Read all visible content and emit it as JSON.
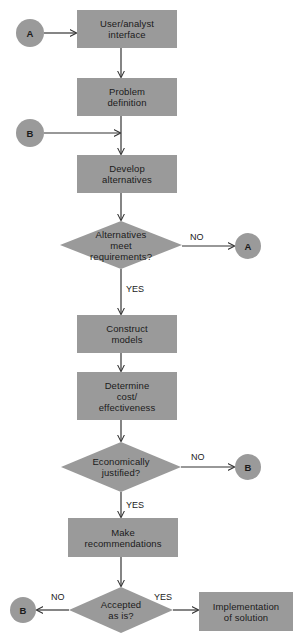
{
  "diagram": {
    "colors": {
      "shape_fill": "#9a9a9a",
      "background": "#ffffff",
      "text": "#1a1a1a",
      "line": "#333333"
    },
    "process_boxes": [
      {
        "id": "user-analyst-interface",
        "label": "User/analyst\ninterface",
        "x": 77,
        "y": 10,
        "w": 100,
        "h": 38
      },
      {
        "id": "problem-definition",
        "label": "Problem\ndefinition",
        "x": 77,
        "y": 78,
        "w": 100,
        "h": 38
      },
      {
        "id": "develop-alternatives",
        "label": "Develop\nalternatives",
        "x": 77,
        "y": 155,
        "w": 100,
        "h": 38
      },
      {
        "id": "construct-models",
        "label": "Construct\nmodels",
        "x": 77,
        "y": 315,
        "w": 100,
        "h": 38
      },
      {
        "id": "determine-cost-effectiveness",
        "label": "Determine\ncost/\neffectiveness",
        "x": 77,
        "y": 372,
        "w": 100,
        "h": 48
      },
      {
        "id": "make-recommendations",
        "label": "Make\nrecommendations",
        "x": 68,
        "y": 518,
        "w": 110,
        "h": 39
      },
      {
        "id": "implementation-of-solution",
        "label": "Implementation\nof solution",
        "x": 199,
        "y": 592,
        "w": 94,
        "h": 39
      }
    ],
    "decision_diamonds": [
      {
        "id": "alternatives-meet-requirements",
        "label": "Alternatives\nmeet\nrequirements?",
        "cx": 121,
        "cy": 245,
        "rx": 61,
        "ry": 24
      },
      {
        "id": "economically-justified",
        "label": "Economically\njustified?",
        "cx": 121,
        "cy": 467,
        "rx": 60,
        "ry": 25
      },
      {
        "id": "accepted-as-is",
        "label": "Accepted\nas is?",
        "cx": 121,
        "cy": 610,
        "rx": 52,
        "ry": 23
      }
    ],
    "connector_circles": [
      {
        "id": "connector-a-left",
        "label": "A",
        "cx": 30,
        "cy": 33,
        "r": 14
      },
      {
        "id": "connector-b-left",
        "label": "B",
        "cx": 30,
        "cy": 133,
        "r": 14
      },
      {
        "id": "connector-a-right",
        "label": "A",
        "cx": 248,
        "cy": 246,
        "r": 13
      },
      {
        "id": "connector-b-right",
        "label": "B",
        "cx": 248,
        "cy": 467,
        "r": 13
      },
      {
        "id": "connector-b-bottom-left",
        "label": "B",
        "cx": 23,
        "cy": 610,
        "r": 13
      }
    ],
    "edge_labels": [
      {
        "id": "alternatives-no",
        "text": "NO",
        "x": 190,
        "y": 232
      },
      {
        "id": "alternatives-yes",
        "text": "YES",
        "x": 126,
        "y": 284
      },
      {
        "id": "economically-no",
        "text": "NO",
        "x": 191,
        "y": 452
      },
      {
        "id": "economically-yes",
        "text": "YES",
        "x": 126,
        "y": 500
      },
      {
        "id": "accepted-no",
        "text": "NO",
        "x": 51,
        "y": 592
      },
      {
        "id": "accepted-yes",
        "text": "YES",
        "x": 154,
        "y": 592
      }
    ]
  }
}
